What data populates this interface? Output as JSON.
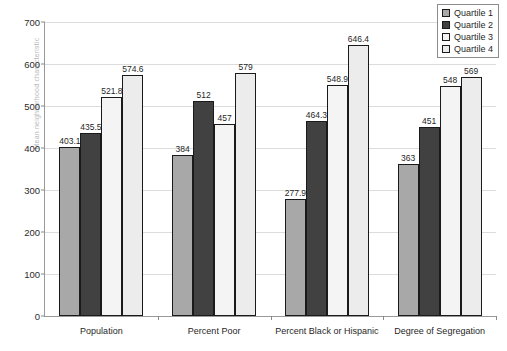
{
  "chart_data": {
    "type": "bar",
    "title": "",
    "xlabel": "",
    "ylabel": "Mean neighborhood characteristic",
    "ylim": [
      0,
      700
    ],
    "ytick_step": 100,
    "yticks": [
      "0",
      "100",
      "200",
      "300",
      "400",
      "500",
      "600",
      "700"
    ],
    "grid": true,
    "legend_position": "top-right",
    "categories": [
      "Population",
      "Percent Poor",
      "Percent Black or Hispanic",
      "Degree of Segregation"
    ],
    "series": [
      {
        "name": "Quartile 1",
        "color": "#a8a8a8",
        "values": [
          403.1,
          384,
          277.9,
          363
        ],
        "labels": [
          "403.1",
          "384",
          "277.9",
          "363"
        ]
      },
      {
        "name": "Quartile 2",
        "color": "#414141",
        "values": [
          435.5,
          512,
          464.3,
          451
        ],
        "labels": [
          "435.5",
          "512",
          "464.3",
          "451"
        ]
      },
      {
        "name": "Quartile 3",
        "color": "#f4f4f4",
        "values": [
          521.8,
          457,
          548.9,
          548
        ],
        "labels": [
          "521.8",
          "457",
          "548.9",
          "548"
        ]
      },
      {
        "name": "Quartile 4",
        "color": "#ececec",
        "values": [
          574.6,
          579,
          646.4,
          569
        ],
        "labels": [
          "574.6",
          "579",
          "646.4",
          "569"
        ]
      }
    ]
  },
  "legend": {
    "items": [
      {
        "label": "Quartile 1",
        "color": "#a8a8a8"
      },
      {
        "label": "Quartile 2",
        "color": "#414141"
      },
      {
        "label": "Quartile 3",
        "color": "#f4f4f4"
      },
      {
        "label": "Quartile 4",
        "color": "#ececec"
      }
    ]
  },
  "axis": {
    "y_title": "Mean neighborhood characteristic"
  }
}
